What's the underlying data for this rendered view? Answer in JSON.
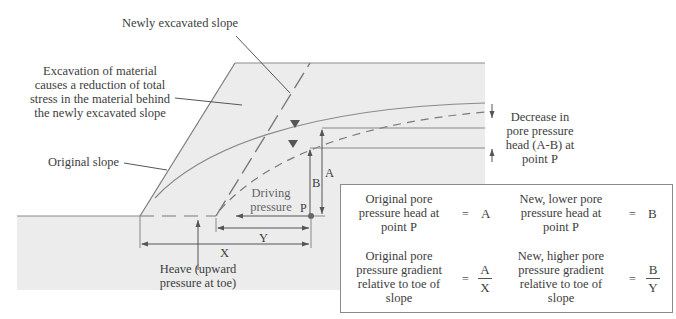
{
  "diagram": {
    "labels": {
      "newly_excavated_slope": "Newly excavated slope",
      "excavation_note": [
        "Excavation of material",
        "causes a reduction of total",
        "stress in the material behind",
        "the newly excavated slope"
      ],
      "original_slope": "Original slope",
      "decrease_note": [
        "Decrease in",
        "pore pressure",
        "head (A-B) at",
        "point P"
      ],
      "driving_pressure": [
        "Driving",
        "pressure"
      ],
      "heave_note": [
        "Heave (upward",
        "pressure at toe)"
      ],
      "point_p": "P",
      "dim_a": "A",
      "dim_b": "B",
      "dim_x": "X",
      "dim_y": "Y"
    },
    "colors": {
      "ground_fill": "#ececec",
      "line": "#7a7a7a",
      "text": "#3d3d3d",
      "arrow": "#555555"
    }
  },
  "legend": {
    "rows": [
      {
        "left_text": [
          "Original pore",
          "pressure head at",
          "point P"
        ],
        "left_eq": "=",
        "left_value": "A",
        "right_text": [
          "New, lower pore",
          "pressure head at",
          "point P"
        ],
        "right_eq": "=",
        "right_value": "B"
      },
      {
        "left_text": [
          "Original pore",
          "pressure gradient",
          "relative to toe of",
          "slope"
        ],
        "left_eq": "=",
        "left_num": "A",
        "left_den": "X",
        "right_text": [
          "New, higher pore",
          "pressure gradient",
          "relative to toe of",
          "slope"
        ],
        "right_eq": "=",
        "right_num": "B",
        "right_den": "Y"
      }
    ]
  }
}
